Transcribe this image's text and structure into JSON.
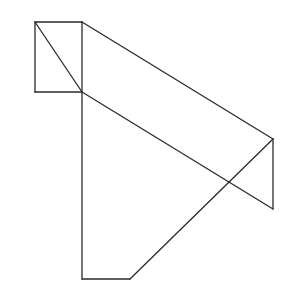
{
  "diagram": {
    "stroke_color": "#2a2a2a",
    "background": "#ffffff",
    "points": {
      "A": [
        35,
        22
      ],
      "B": [
        82,
        22
      ],
      "C": [
        82,
        92
      ],
      "D": [
        35,
        92
      ],
      "E": [
        273,
        139
      ],
      "F": [
        273,
        209
      ],
      "G": [
        82,
        279
      ],
      "H": [
        130,
        279
      ]
    },
    "segments": [
      [
        "A",
        "B"
      ],
      [
        "B",
        "C"
      ],
      [
        "C",
        "D"
      ],
      [
        "D",
        "A"
      ],
      [
        "A",
        "C"
      ],
      [
        "B",
        "E"
      ],
      [
        "C",
        "F"
      ],
      [
        "E",
        "F"
      ],
      [
        "C",
        "G"
      ],
      [
        "G",
        "H"
      ],
      [
        "H",
        "E"
      ]
    ]
  }
}
